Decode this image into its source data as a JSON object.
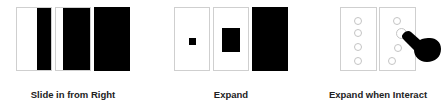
{
  "groups": [
    {
      "label": "Slide in from Right",
      "frames": [
        "frame-1-partial-slide",
        "frame-2-more-slide",
        "frame-3-full"
      ]
    },
    {
      "label": "Expand",
      "frames": [
        "frame-1-small-square",
        "frame-2-medium-rect",
        "frame-3-full"
      ]
    },
    {
      "label": "Expand when Interact",
      "frames": [
        "frame-1-circles",
        "frame-2-circles-with-hand"
      ],
      "icon": "hand-pointer-icon"
    }
  ],
  "colors": {
    "fill": "#000000",
    "border": "#cfcfcf",
    "circle": "#c4c4c4",
    "label": "#222222"
  }
}
